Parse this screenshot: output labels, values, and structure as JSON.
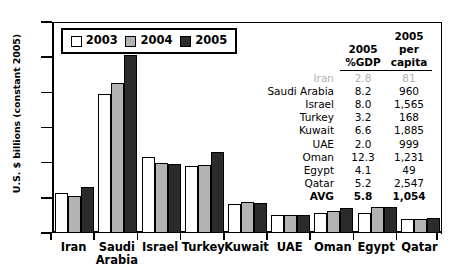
{
  "chart_data": {
    "type": "bar",
    "title": "",
    "xlabel": "",
    "ylabel": "U.S. $ billions (constant 2005)",
    "ylim": [
      0,
      30
    ],
    "yticks": [
      0,
      5,
      10,
      15,
      20,
      25,
      30
    ],
    "ytick_labels": [
      "0",
      "5",
      "10",
      "15",
      "20",
      "25",
      "30"
    ],
    "grid": false,
    "legend_position": "top-left-inside",
    "categories": [
      "Iran",
      "Saudi Arabia",
      "Israel",
      "Turkey",
      "Kuwait",
      "UAE",
      "Oman",
      "Egypt",
      "Qatar"
    ],
    "series": [
      {
        "name": "2003",
        "color": "#ffffff",
        "values": [
          5.7,
          19.7,
          10.8,
          9.5,
          4.1,
          2.6,
          2.8,
          2.9,
          2.0
        ]
      },
      {
        "name": "2004",
        "color": "#b3b3b3",
        "values": [
          5.3,
          21.4,
          9.9,
          9.6,
          4.4,
          2.5,
          3.1,
          3.7,
          2.0
        ]
      },
      {
        "name": "2005",
        "color": "#2b2b2b",
        "values": [
          6.6,
          25.3,
          9.8,
          11.5,
          4.3,
          2.6,
          3.6,
          3.7,
          2.1
        ]
      }
    ]
  },
  "legend": {
    "items": [
      {
        "label": "2003"
      },
      {
        "label": "2004"
      },
      {
        "label": "2005"
      }
    ]
  },
  "axis": {
    "y_title": "U.S. $ billions (constant 2005)",
    "y_labels": [
      "30",
      "25",
      "20",
      "15",
      "10",
      "5",
      "0"
    ],
    "x_labels": [
      "Iran",
      "Saudi\nArabia",
      "Israel",
      "Turkey",
      "Kuwait",
      "UAE",
      "Oman",
      "Egypt",
      "Qatar"
    ]
  },
  "side_table": {
    "headers": {
      "name": "",
      "gdp_line1": "2005",
      "gdp_line2": "%GDP",
      "capita_line1": "2005",
      "capita_line2": "per",
      "capita_line3": "capita"
    },
    "rows": [
      {
        "name": "Iran",
        "gdp": "2.8",
        "per_capita": "81",
        "style": "dim"
      },
      {
        "name": "Saudi Arabia",
        "gdp": "8.2",
        "per_capita": "960",
        "style": "normal"
      },
      {
        "name": "Israel",
        "gdp": "8.0",
        "per_capita": "1,565",
        "style": "normal"
      },
      {
        "name": "Turkey",
        "gdp": "3.2",
        "per_capita": "168",
        "style": "normal"
      },
      {
        "name": "Kuwait",
        "gdp": "6.6",
        "per_capita": "1,885",
        "style": "normal"
      },
      {
        "name": "UAE",
        "gdp": "2.0",
        "per_capita": "999",
        "style": "normal"
      },
      {
        "name": "Oman",
        "gdp": "12.3",
        "per_capita": "1,231",
        "style": "normal"
      },
      {
        "name": "Egypt",
        "gdp": "4.1",
        "per_capita": "49",
        "style": "normal"
      },
      {
        "name": "Qatar",
        "gdp": "5.2",
        "per_capita": "2,547",
        "style": "normal"
      },
      {
        "name": "AVG",
        "gdp": "5.8",
        "per_capita": "1,054",
        "style": "avg"
      }
    ]
  }
}
